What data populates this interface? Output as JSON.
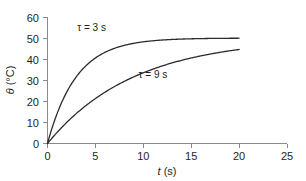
{
  "chart_data": {
    "type": "line",
    "title": "",
    "subtitle": "",
    "xlabel": "t (s)",
    "xlabel_symbol": "t",
    "xlabel_unit": "(s)",
    "ylabel": "θ (°C)",
    "ylabel_symbol": "θ",
    "ylabel_unit": "(°C)",
    "xlim": [
      0,
      25
    ],
    "ylim": [
      0,
      60
    ],
    "xticks": [
      0,
      5,
      10,
      15,
      20,
      25
    ],
    "yticks": [
      0,
      10,
      20,
      30,
      40,
      50,
      60
    ],
    "xtick_labels": [
      "0",
      "5",
      "10",
      "15",
      "20",
      "25"
    ],
    "ytick_labels": [
      "0",
      "10",
      "20",
      "30",
      "40",
      "50",
      "60"
    ],
    "grid": false,
    "legend": "inline-annotations",
    "legend_position": "inline",
    "asymptote": 50,
    "model": "theta = 50 * (1 - exp(-t / tau))",
    "series": [
      {
        "name": "τ = 3 s",
        "tau": 3,
        "annotation": "τ = 3 s",
        "color": "#2b2b2b",
        "x": [
          0,
          0.5,
          1,
          1.5,
          2,
          2.5,
          3,
          3.5,
          4,
          5,
          6,
          7,
          8,
          9,
          10,
          11,
          12,
          13,
          14,
          15,
          16,
          17,
          18,
          19,
          20
        ],
        "y": [
          0,
          7.7,
          14.2,
          19.7,
          24.3,
          28.2,
          31.6,
          34.4,
          36.8,
          40.6,
          43.2,
          45.1,
          46.4,
          47.5,
          48.2,
          48.7,
          49.1,
          49.4,
          49.5,
          49.7,
          49.8,
          49.8,
          49.9,
          49.9,
          49.9
        ]
      },
      {
        "name": "τ = 9 s",
        "tau": 9,
        "annotation": "τ = 9 s",
        "color": "#2b2b2b",
        "x": [
          0,
          1,
          2,
          3,
          4,
          5,
          6,
          7,
          8,
          9,
          10,
          11,
          12,
          13,
          14,
          15,
          16,
          17,
          18,
          19,
          20
        ],
        "y": [
          0,
          5.3,
          10.0,
          14.3,
          18.1,
          21.6,
          24.7,
          27.5,
          30.0,
          33.4,
          33.6,
          35.2,
          36.7,
          38.0,
          39.2,
          40.3,
          41.2,
          42.1,
          42.9,
          43.6,
          44.6
        ]
      }
    ],
    "annotations": [
      {
        "text": "τ = 3 s",
        "x": 4.6,
        "y": 53.5
      },
      {
        "text": "τ = 9 s",
        "x": 11.0,
        "y": 31.0
      }
    ]
  },
  "axis_titles": {
    "x_symbol": "t",
    "x_unit": " (s)",
    "y_symbol": "θ",
    "y_unit": " (°C)"
  },
  "caption": {
    "text": ""
  }
}
